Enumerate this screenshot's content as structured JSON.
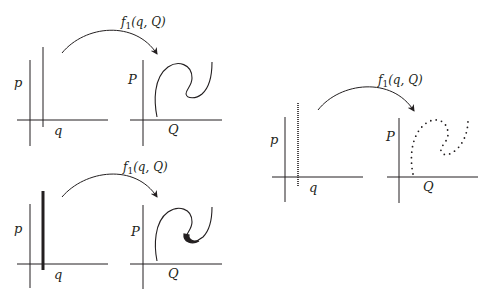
{
  "figure": {
    "panels": [
      {
        "id": "top-left",
        "mapping_label": "f",
        "mapping_subscript": "1",
        "mapping_args": "(q, Q)",
        "domain_axes": {
          "vertical_label": "p",
          "horizontal_label": "q"
        },
        "codomain_axes": {
          "vertical_label": "P",
          "horizontal_label": "Q"
        },
        "style": "thin-line"
      },
      {
        "id": "bottom-left",
        "mapping_label": "f",
        "mapping_subscript": "1",
        "mapping_args": "(q, Q)",
        "domain_axes": {
          "vertical_label": "p",
          "horizontal_label": "q"
        },
        "codomain_axes": {
          "vertical_label": "P",
          "horizontal_label": "Q"
        },
        "style": "thick-line"
      },
      {
        "id": "right",
        "mapping_label": "f",
        "mapping_subscript": "1",
        "mapping_args": "(q, Q)",
        "domain_axes": {
          "vertical_label": "p",
          "horizontal_label": "q"
        },
        "codomain_axes": {
          "vertical_label": "P",
          "horizontal_label": "Q"
        },
        "style": "dotted-line"
      }
    ],
    "colors": {
      "ink": "#231f20",
      "background": "#ffffff"
    }
  }
}
